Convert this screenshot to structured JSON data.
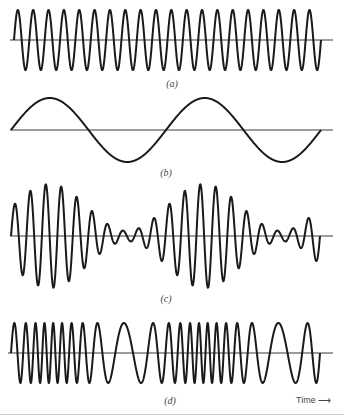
{
  "figure": {
    "panels": [
      {
        "id": "a",
        "label": "(a)",
        "kind": "carrier",
        "axis_y": 40,
        "amp": 30,
        "cycles": 20,
        "x_start": 14,
        "x_end": 321,
        "axis_x0": 10,
        "axis_x1": 333,
        "label_x": 172,
        "label_y": 78
      },
      {
        "id": "b",
        "label": "(b)",
        "kind": "modulating",
        "axis_y": 130,
        "amp": 32,
        "cycles": 2,
        "x_start": 11,
        "x_end": 321,
        "axis_x0": 10,
        "axis_x1": 333,
        "label_x": 166,
        "label_y": 167
      },
      {
        "id": "c",
        "label": "(c)",
        "kind": "am",
        "axis_y": 236,
        "amp": 52,
        "cycles": 20,
        "mod_index": 0.82,
        "mod_cycles": 2,
        "x_start": 11,
        "x_end": 320,
        "axis_x0": 10,
        "axis_x1": 333,
        "label_x": 166,
        "label_y": 293
      },
      {
        "id": "d",
        "label": "(d)",
        "kind": "fm",
        "axis_y": 353,
        "amp": 30,
        "cycles": 22,
        "freq_dev": 0.62,
        "mod_cycles": 2,
        "x_start": 11,
        "x_end": 320,
        "axis_x0": 8,
        "axis_x1": 333,
        "label_x": 170,
        "label_y": 395
      }
    ],
    "time_axis": {
      "label": "Time",
      "arrow": "⟶"
    },
    "colors": {
      "line": "#1a1a1a",
      "axis": "#3a3a3a",
      "background": "#ffffff",
      "label": "#444444"
    }
  },
  "chart_data": {
    "type": "line",
    "xlabel": "Time",
    "ylabel": "",
    "series": [
      {
        "name": "(a) carrier",
        "description": "constant-amplitude sinusoid, ~20 cycles"
      },
      {
        "name": "(b) modulating signal",
        "description": "low-frequency sinusoid, 2 cycles"
      },
      {
        "name": "(c) amplitude-modulated wave",
        "description": "carrier with envelope following (b)"
      },
      {
        "name": "(d) frequency-modulated wave",
        "description": "carrier with frequency following (b)"
      }
    ],
    "grid": false
  }
}
